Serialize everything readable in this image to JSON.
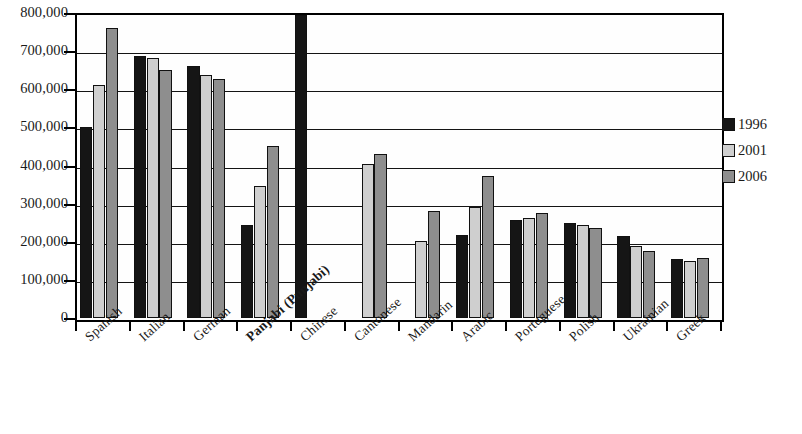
{
  "chart_data": {
    "type": "bar",
    "title": "",
    "xlabel": "",
    "ylabel": "",
    "ylim": [
      0,
      800000
    ],
    "ytick_labels": [
      "800,000",
      "700,000",
      "600,000",
      "500,000",
      "400,000",
      "300,000",
      "200,000",
      "100,000",
      "0"
    ],
    "ytick_values": [
      800000,
      700000,
      600000,
      500000,
      400000,
      300000,
      200000,
      100000,
      0
    ],
    "grid": true,
    "legend_position": "right",
    "categories": [
      "Spanish",
      "Italian",
      "German",
      "Panjabi (Punjabi)",
      "Chinese",
      "Cantonese",
      "Mandarin",
      "Arabic",
      "Portuguese",
      "Polish",
      "Ukrainian",
      "Greek"
    ],
    "series": [
      {
        "name": "1996",
        "color": "#151515",
        "values": [
          501000,
          688000,
          661000,
          245000,
          795000,
          null,
          null,
          217000,
          258000,
          250000,
          215000,
          155000
        ]
      },
      {
        "name": "2001",
        "color": "#cfcfcf",
        "values": [
          612000,
          682000,
          637000,
          345000,
          null,
          403000,
          203000,
          290000,
          263000,
          245000,
          190000,
          150000
        ]
      },
      {
        "name": "2006",
        "color": "#8e8e8e",
        "values": [
          762000,
          650000,
          627000,
          452000,
          null,
          430000,
          282000,
          372000,
          275000,
          235000,
          177000,
          158000
        ]
      }
    ]
  },
  "legend": {
    "entries": [
      {
        "label": "1996",
        "swatch": "black-swatch"
      },
      {
        "label": "2001",
        "swatch": "light-gray-swatch"
      },
      {
        "label": "2006",
        "swatch": "dark-gray-swatch"
      }
    ]
  }
}
